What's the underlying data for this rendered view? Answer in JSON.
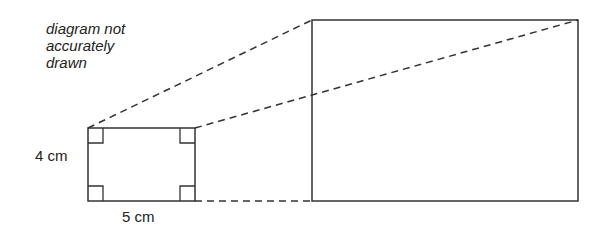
{
  "diagram": {
    "note": "diagram not\naccurately\ndrawn",
    "small_rectangle": {
      "height_label": "4 cm",
      "width_label": "5 cm",
      "right_angle_markers": 4
    },
    "large_rectangle": {
      "labels": []
    },
    "colors": {
      "line": "#333333",
      "text": "#222222",
      "background": "#ffffff"
    }
  }
}
